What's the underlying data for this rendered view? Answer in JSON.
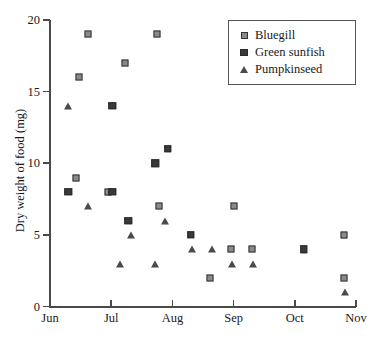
{
  "chart_data": {
    "type": "scatter",
    "title": "",
    "xlabel": "",
    "ylabel": "Dry weight of food (mg)",
    "grid": false,
    "legend_position": "top-right",
    "x_axis": {
      "tick_labels": [
        "Jun",
        "Jul",
        "Aug",
        "Sep",
        "Oct",
        "Nov"
      ],
      "tick_values": [
        0,
        1,
        2,
        3,
        4,
        5
      ],
      "xlim": [
        0,
        5
      ],
      "units": "month"
    },
    "y_axis": {
      "tick_labels": [
        "0",
        "5",
        "10",
        "15",
        "20"
      ],
      "tick_values": [
        0,
        5,
        10,
        15,
        20
      ],
      "ylim": [
        0,
        20
      ],
      "units": "mg"
    },
    "series": [
      {
        "name": "Bluegill",
        "marker": "square-open",
        "color": "#8a8a8a",
        "edge_color": "#333333",
        "points": [
          {
            "x": 0.48,
            "y": 16
          },
          {
            "x": 0.62,
            "y": 19
          },
          {
            "x": 0.42,
            "y": 9
          },
          {
            "x": 0.95,
            "y": 8
          },
          {
            "x": 1.22,
            "y": 17
          },
          {
            "x": 1.75,
            "y": 19
          },
          {
            "x": 1.78,
            "y": 7
          },
          {
            "x": 2.62,
            "y": 2
          },
          {
            "x": 2.95,
            "y": 4
          },
          {
            "x": 3.0,
            "y": 7
          },
          {
            "x": 3.3,
            "y": 4
          },
          {
            "x": 4.8,
            "y": 5
          },
          {
            "x": 4.8,
            "y": 2
          }
        ]
      },
      {
        "name": "Green sunfish",
        "marker": "square-filled",
        "color": "#3a3a3a",
        "edge_color": "#2a2a2a",
        "points": [
          {
            "x": 0.3,
            "y": 8
          },
          {
            "x": 1.02,
            "y": 14
          },
          {
            "x": 1.02,
            "y": 8
          },
          {
            "x": 1.28,
            "y": 6
          },
          {
            "x": 1.72,
            "y": 10
          },
          {
            "x": 1.92,
            "y": 11
          },
          {
            "x": 2.3,
            "y": 5
          },
          {
            "x": 4.15,
            "y": 4
          }
        ]
      },
      {
        "name": "Pumpkinseed",
        "marker": "triangle",
        "color": "#4a4a4a",
        "edge_color": "#4a4a4a",
        "points": [
          {
            "x": 0.3,
            "y": 14
          },
          {
            "x": 0.62,
            "y": 7
          },
          {
            "x": 1.15,
            "y": 3
          },
          {
            "x": 1.33,
            "y": 5
          },
          {
            "x": 1.72,
            "y": 3
          },
          {
            "x": 1.88,
            "y": 6
          },
          {
            "x": 2.32,
            "y": 4
          },
          {
            "x": 2.65,
            "y": 4
          },
          {
            "x": 2.98,
            "y": 3
          },
          {
            "x": 3.32,
            "y": 3
          },
          {
            "x": 4.82,
            "y": 1
          }
        ]
      }
    ]
  },
  "legend": {
    "entries": [
      {
        "label": "Bluegill",
        "marker": "square-open"
      },
      {
        "label": "Green sunfish",
        "marker": "square-filled"
      },
      {
        "label": "Pumpkinseed",
        "marker": "triangle"
      }
    ]
  }
}
